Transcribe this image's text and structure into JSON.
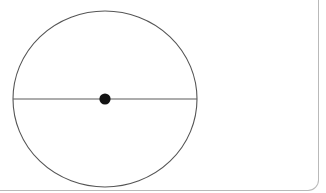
{
  "figure": {
    "type": "geometry-diagram",
    "title": "Circle with horizontal diameter and marked centre point",
    "background_color": "#ffffff",
    "width": 326,
    "height": 193,
    "shapes": {
      "circle": {
        "name": "circle-outline",
        "center_x": 105,
        "center_y": 99,
        "radius_x": 92,
        "radius_y": 88,
        "stroke_color": "#555555",
        "stroke_width": 1.1,
        "fill": "none"
      },
      "diameter": {
        "name": "horizontal-diameter-line",
        "x1": 13,
        "y1": 99,
        "x2": 197,
        "y2": 99,
        "stroke_color": "#5a5a5a",
        "stroke_width": 1.2
      },
      "center_point": {
        "name": "center-point-dot",
        "cx": 105,
        "cy": 99,
        "r": 5.6,
        "fill_color": "#131313"
      }
    }
  },
  "panel": {
    "name": "figure-panel",
    "border_color": "#b9b9b9",
    "corner_radius": 11,
    "right_edge_x": 318,
    "bottom_edge_y": 190
  }
}
